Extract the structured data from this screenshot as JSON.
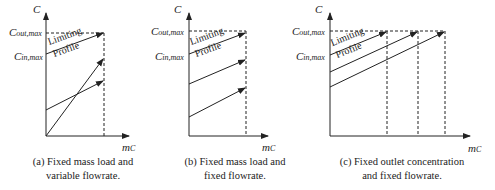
{
  "panels": [
    {
      "id": "a",
      "y_axis_label": "C",
      "x_axis_label": "m",
      "x_axis_subscript": "C",
      "c_out_label": "C",
      "c_out_sub": "out,max",
      "c_in_label": "C",
      "c_in_sub": "in,max",
      "profile_text_1": "Limiting",
      "profile_text_2": "Profile",
      "caption_line1": "(a) Fixed mass load and",
      "caption_line2": "variable flowrate."
    },
    {
      "id": "b",
      "y_axis_label": "C",
      "x_axis_label": "m",
      "x_axis_subscript": "C",
      "c_out_label": "C",
      "c_out_sub": "out,max",
      "c_in_label": "C",
      "c_in_sub": "in,max",
      "profile_text_1": "Limiting",
      "profile_text_2": "Profile",
      "caption_line1": "(b) Fixed mass load and",
      "caption_line2": "fixed flowrate."
    },
    {
      "id": "c",
      "y_axis_label": "C",
      "x_axis_label": "m",
      "x_axis_subscript": "C",
      "c_out_label": "C",
      "c_out_sub": "out,max",
      "c_in_label": "C",
      "c_in_sub": "in,max",
      "profile_text_1": "Limiting",
      "profile_text_2": "Profile",
      "caption_line1": "(c) Fixed outlet concentration",
      "caption_line2": "and fixed flowrate."
    }
  ],
  "colors": {
    "line": "#222222",
    "background": "#ffffff"
  }
}
